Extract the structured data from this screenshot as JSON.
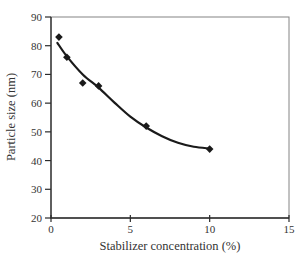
{
  "chart_data": {
    "type": "scatter",
    "title": "",
    "xlabel": "Stabilizer concentration (%)",
    "ylabel": "Particle size (nm)",
    "xlim": [
      0,
      15
    ],
    "ylim": [
      20,
      90
    ],
    "xticks": [
      0,
      5,
      10,
      15
    ],
    "yticks": [
      20,
      30,
      40,
      50,
      60,
      70,
      80,
      90
    ],
    "grid": false,
    "marker": "diamond",
    "points": [
      [
        0.5,
        83
      ],
      [
        1,
        76
      ],
      [
        2,
        67
      ],
      [
        3,
        66
      ],
      [
        6,
        52
      ],
      [
        10,
        44
      ]
    ],
    "trend": [
      [
        0.4,
        81.0
      ],
      [
        1,
        76.3
      ],
      [
        2,
        70.0
      ],
      [
        3,
        65.4
      ],
      [
        4,
        60.2
      ],
      [
        5,
        55.3
      ],
      [
        6,
        51.5
      ],
      [
        7,
        48.5
      ],
      [
        8,
        46.2
      ],
      [
        9,
        44.8
      ],
      [
        10,
        44.2
      ]
    ],
    "colors": {
      "marker": "#1a1a1a",
      "line": "#1a1a1a",
      "axis": "#2b2b2b",
      "frame": "#848484",
      "text": "#333333",
      "background": "#ffffff"
    }
  }
}
